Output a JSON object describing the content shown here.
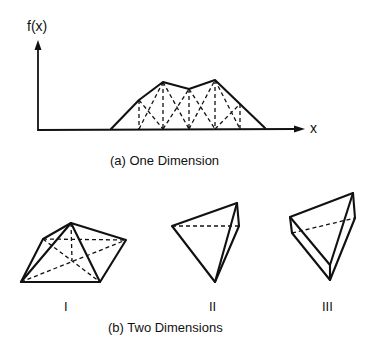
{
  "figure": {
    "one_dimension": {
      "y_axis_label": "f(x)",
      "x_axis_label": "x",
      "caption": "(a) One Dimension",
      "polyline": [
        [
          111,
          129
        ],
        [
          139,
          100
        ],
        [
          163,
          82
        ],
        [
          189,
          89
        ],
        [
          215,
          80
        ],
        [
          240,
          104
        ],
        [
          265,
          128
        ]
      ],
      "nodes_x": [
        139,
        163,
        189,
        215,
        240
      ],
      "baseline_y": 129
    },
    "two_dimensions": {
      "caption": "(b) Two Dimensions",
      "elements": [
        {
          "label": "I",
          "type": "pyramid"
        },
        {
          "label": "II",
          "type": "tetrahedron"
        },
        {
          "label": "III",
          "type": "prism-tetrahedron"
        }
      ]
    }
  }
}
